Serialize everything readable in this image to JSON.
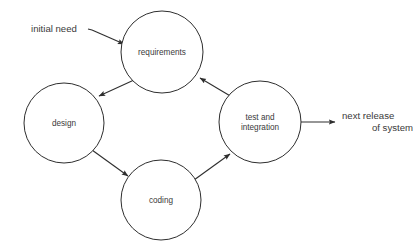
{
  "diagram": {
    "type": "cyclic-process-diagram",
    "background_color": "#ffffff",
    "stroke_color": "#2e2e2e",
    "text_color": "#3a3a3a",
    "nodes": [
      {
        "id": "requirements",
        "label": "requirements",
        "cx": 162,
        "cy": 52,
        "r": 41
      },
      {
        "id": "design",
        "label": "design",
        "cx": 64,
        "cy": 123,
        "r": 40
      },
      {
        "id": "coding",
        "label": "coding",
        "cx": 161,
        "cy": 200,
        "r": 40
      },
      {
        "id": "test-and-integration",
        "label_line1": "test and",
        "label_line2": "integration",
        "cx": 260,
        "cy": 122,
        "r": 41
      }
    ],
    "edges": [
      {
        "id": "requirements-to-design",
        "from": "requirements",
        "to": "design"
      },
      {
        "id": "design-to-coding",
        "from": "design",
        "to": "coding"
      },
      {
        "id": "coding-to-test",
        "from": "coding",
        "to": "test-and-integration"
      },
      {
        "id": "test-to-requirements",
        "from": "test-and-integration",
        "to": "requirements"
      }
    ],
    "input": {
      "id": "initial-need",
      "label": "initial need",
      "target": "requirements"
    },
    "output": {
      "id": "next-release-of-system",
      "label_line1": "next release",
      "label_line2": "of system",
      "source": "test-and-integration"
    }
  }
}
